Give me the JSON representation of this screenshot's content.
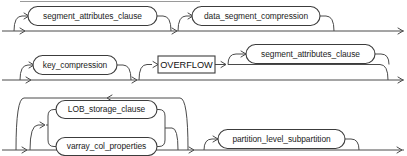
{
  "diagram": {
    "type": "railroad-syntax-diagram",
    "line_color": "#4a4a4a",
    "text_color": "#1c1c1c",
    "background": "#ffffff",
    "rows": [
      {
        "id": "row-1",
        "rail_y": 31,
        "nodes": [
          {
            "id": "segment-attributes-clause-1",
            "shape": "oval",
            "label": "segment_attributes_clause",
            "optional": true,
            "x": 28,
            "y": 6,
            "w": 129,
            "h": 19
          },
          {
            "id": "data-segment-compression-1",
            "shape": "oval",
            "label": "data_segment_compression",
            "optional": true,
            "x": 192,
            "y": 6,
            "w": 128,
            "h": 19
          }
        ]
      },
      {
        "id": "row-2",
        "rail_y": 80,
        "nodes": [
          {
            "id": "key-compression-1",
            "shape": "oval",
            "label": "key_compression",
            "optional": true,
            "x": 33,
            "y": 55,
            "w": 84,
            "h": 19
          },
          {
            "id": "overflow-keyword",
            "shape": "box",
            "label": "OVERFLOW",
            "optional": true,
            "x": 158,
            "y": 56,
            "w": 57,
            "h": 17
          },
          {
            "id": "segment-attributes-clause-2",
            "shape": "oval",
            "label": "segment_attributes_clause",
            "optional": true,
            "x": 246,
            "y": 44,
            "w": 129,
            "h": 19
          }
        ]
      },
      {
        "id": "row-3",
        "rail_y": 150,
        "nodes": [
          {
            "id": "lob-storage-clause",
            "shape": "oval",
            "label": "LOB_storage_clause",
            "optional": true,
            "x": 56,
            "y": 107,
            "w": 101,
            "h": 18,
            "group": "repeat-group"
          },
          {
            "id": "varray-col-properties",
            "shape": "oval",
            "label": "varray_col_properties",
            "optional": true,
            "x": 56,
            "y": 131,
            "w": 101,
            "h": 18,
            "group": "repeat-group"
          },
          {
            "id": "partition-level-subpartition",
            "shape": "oval",
            "label": "partition_level_subpartition",
            "optional": true,
            "x": 218,
            "y": 129,
            "w": 127,
            "h": 19
          }
        ],
        "repeat_loop": {
          "id": "lob-repeat-loop",
          "arrow_direction": "left",
          "arrow_x": 108,
          "arrow_y": 98
        }
      }
    ],
    "labels": {
      "segment_attributes_clause": "segment_attributes_clause",
      "data_segment_compression": "data_segment_compression",
      "key_compression": "key_compression",
      "overflow": "OVERFLOW",
      "segment_attributes_clause_2": "segment_attributes_clause",
      "lob_storage_clause": "LOB_storage_clause",
      "varray_col_properties": "varray_col_properties",
      "partition_level_subpartition": "partition_level_subpartition"
    }
  }
}
